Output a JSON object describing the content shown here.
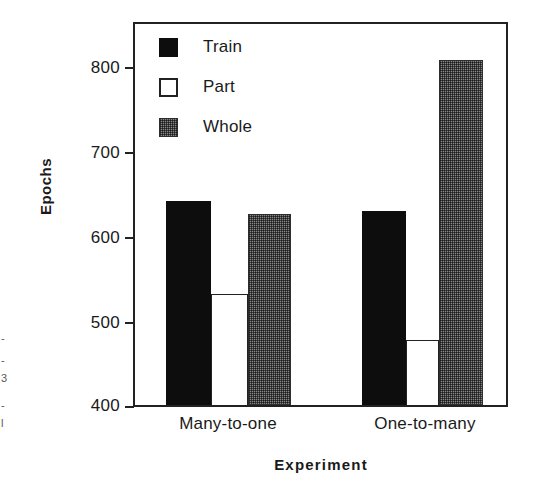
{
  "chart_data": {
    "type": "bar",
    "title": "",
    "subtitle": "",
    "xlabel": "Experiment",
    "ylabel": "Epochs",
    "categories": [
      "Many-to-one",
      "One-to-many"
    ],
    "series": [
      {
        "name": "Train",
        "values": [
          636,
          624
        ],
        "color": "#0d0d0d",
        "fill": "solid-black"
      },
      {
        "name": "Part",
        "values": [
          528,
          475
        ],
        "color": "#ffffff",
        "fill": "white-outline"
      },
      {
        "name": "Whole",
        "values": [
          621,
          798
        ],
        "color": "#878787",
        "fill": "gray-dither"
      }
    ],
    "ylim": [
      400,
      840
    ],
    "yticks": [
      400,
      500,
      600,
      700,
      800
    ],
    "ytick_labels": [
      "400",
      "500",
      "600",
      "700",
      "800"
    ],
    "grid": false,
    "legend_position": "top-left",
    "frame": "box"
  },
  "legend": {
    "items": [
      {
        "label": "Train",
        "swatch": "solid-black-square"
      },
      {
        "label": "Part",
        "swatch": "white-outline-square"
      },
      {
        "label": "Whole",
        "swatch": "gray-dither-square"
      }
    ]
  },
  "axes": {
    "y_title": "Epochs",
    "x_title": "Experiment",
    "y_tick_labels": [
      "800",
      "700",
      "600",
      "500",
      "400"
    ],
    "x_group_labels": [
      "Many-to-one",
      "One-to-many"
    ]
  },
  "scan_artifacts": [
    {
      "text": "-",
      "x": 1,
      "y": 335
    },
    {
      "text": "-",
      "x": 1,
      "y": 357
    },
    {
      "text": "3",
      "x": 1,
      "y": 376
    },
    {
      "text": "-",
      "x": 1,
      "y": 402
    },
    {
      "text": "l",
      "x": 1,
      "y": 420
    }
  ]
}
